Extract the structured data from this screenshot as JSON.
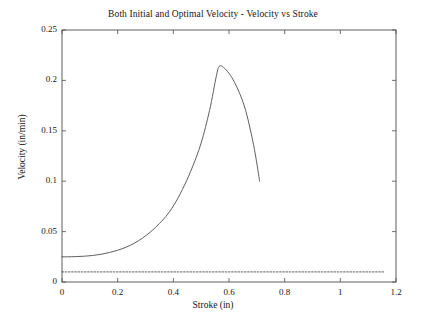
{
  "chart_data": {
    "type": "line",
    "title": "Both Initial and Optimal Velocity - Velocity vs Stroke",
    "xlabel": "Stroke (in)",
    "ylabel": "Velocity (in/min)",
    "xlim": [
      0,
      1.2
    ],
    "ylim": [
      0,
      0.25
    ],
    "xticks": [
      "0",
      "0.2",
      "0.4",
      "0.6",
      "0.8",
      "1",
      "1.2"
    ],
    "xtick_values": [
      0,
      0.2,
      0.4,
      0.6,
      0.8,
      1.0,
      1.2
    ],
    "yticks": [
      "0",
      "0.05",
      "0.1",
      "0.15",
      "0.2",
      "0.25"
    ],
    "ytick_values": [
      0,
      0.05,
      0.1,
      0.15,
      0.2,
      0.25
    ],
    "grid": false,
    "legend": "none",
    "box": true,
    "series": [
      {
        "name": "Optimal Velocity",
        "style": "solid",
        "color": "#4d4d4d",
        "x": [
          0.0,
          0.02,
          0.05,
          0.08,
          0.11,
          0.14,
          0.17,
          0.2,
          0.23,
          0.26,
          0.29,
          0.32,
          0.35,
          0.38,
          0.41,
          0.44,
          0.47,
          0.5,
          0.53,
          0.555,
          0.565,
          0.58,
          0.6,
          0.62,
          0.64,
          0.66,
          0.68,
          0.695,
          0.71
        ],
        "y": [
          0.025,
          0.025,
          0.0252,
          0.0256,
          0.0263,
          0.0275,
          0.0292,
          0.0315,
          0.0345,
          0.0385,
          0.0437,
          0.0502,
          0.058,
          0.0674,
          0.08,
          0.096,
          0.115,
          0.138,
          0.17,
          0.205,
          0.214,
          0.213,
          0.207,
          0.198,
          0.186,
          0.17,
          0.147,
          0.126,
          0.1
        ]
      },
      {
        "name": "Initial Velocity",
        "style": "dotted",
        "color": "#4d4d4d",
        "x": [
          0.0,
          1.16
        ],
        "y": [
          0.01,
          0.01
        ]
      }
    ]
  },
  "layout": {
    "plot_left_px": 62,
    "plot_right_px": 396,
    "plot_top_px": 30,
    "plot_bottom_px": 282,
    "axis_color": "#4d4d4d",
    "background": "#ffffff"
  }
}
